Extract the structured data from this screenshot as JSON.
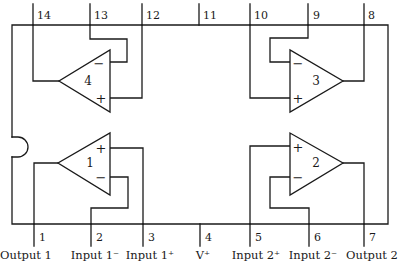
{
  "diagram": {
    "package": {
      "outline": {
        "x": 12,
        "y": 25,
        "width": 376,
        "height": 199
      },
      "notch_side": "left",
      "line_color": "#1a1a1a",
      "background": "#ffffff"
    },
    "top_pins": [
      {
        "number": "14",
        "x": 33
      },
      {
        "number": "13",
        "x": 90
      },
      {
        "number": "12",
        "x": 142
      },
      {
        "number": "11",
        "x": 199
      },
      {
        "number": "10",
        "x": 250
      },
      {
        "number": "9",
        "x": 308
      },
      {
        "number": "8",
        "x": 364
      }
    ],
    "bottom_pins": [
      {
        "number": "1",
        "x": 34,
        "label": "Output 1"
      },
      {
        "number": "2",
        "x": 91,
        "label": "Input 1⁻"
      },
      {
        "number": "3",
        "x": 143,
        "label": "Input 1⁺"
      },
      {
        "number": "4",
        "x": 200,
        "label": "V⁺"
      },
      {
        "number": "5",
        "x": 250,
        "label": "Input 2⁺"
      },
      {
        "number": "6",
        "x": 309,
        "label": "Input 2⁻"
      },
      {
        "number": "7",
        "x": 364,
        "label": "Output 2"
      }
    ],
    "amplifiers": [
      {
        "id": "4",
        "orientation": "left",
        "minus_sign": "−",
        "plus_sign": "+"
      },
      {
        "id": "3",
        "orientation": "right",
        "minus_sign": "−",
        "plus_sign": "+"
      },
      {
        "id": "1",
        "orientation": "left",
        "minus_sign": "−",
        "plus_sign": "+"
      },
      {
        "id": "2",
        "orientation": "right",
        "minus_sign": "−",
        "plus_sign": "+"
      }
    ]
  }
}
